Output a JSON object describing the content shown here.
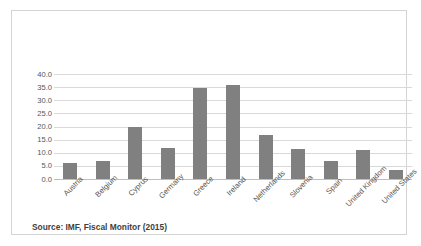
{
  "figure": {
    "source_note": "Source: IMF, Fiscal Monitor (2015)",
    "border_color": "#d4d4d4",
    "background_color": "#ffffff"
  },
  "chart_data": {
    "type": "bar",
    "title": "",
    "subtitle": "",
    "xlabel": "",
    "ylabel": "",
    "categories": [
      "Austria",
      "Belgium",
      "Cyprus",
      "Germany",
      "Greece",
      "Ireland",
      "Netherlands",
      "Slovenia",
      "Spain",
      "United Kingdom",
      "United States"
    ],
    "values": [
      6.0,
      7.0,
      19.8,
      12.0,
      34.5,
      35.8,
      16.7,
      11.5,
      6.7,
      10.9,
      3.4
    ],
    "ylim": [
      0.0,
      40.0
    ],
    "ytick_step": 5.0,
    "ytick_labels": [
      "40.0",
      "35.0",
      "30.0",
      "25.0",
      "20.0",
      "15.0",
      "10.0",
      "5.0",
      "0.0"
    ],
    "ytick_values": [
      40.0,
      35.0,
      30.0,
      25.0,
      20.0,
      15.0,
      10.0,
      5.0,
      0.0
    ],
    "grid": true,
    "grid_axis": "y",
    "grid_color": "#d9d9d9",
    "legend": false,
    "legend_position": "none",
    "bar_color": "#808080",
    "axis_color": "#bfbfbf",
    "xtick_rotation": -45
  }
}
